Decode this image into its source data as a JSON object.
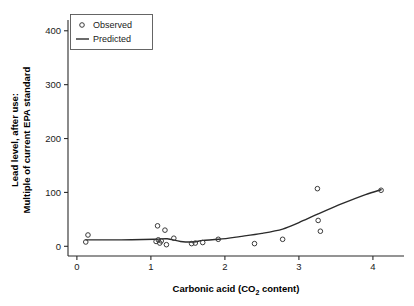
{
  "chart_data": {
    "type": "scatter",
    "title": "",
    "xlabel": "Carbonic acid (CO2 content)",
    "xlabel_main": "Carbonic acid (CO",
    "xlabel_sub": "2",
    "xlabel_tail": " content)",
    "ylabel_line1": "Lead level, after use:",
    "ylabel_line2": "Multiple of current EPA standard",
    "xlim": [
      -0.12,
      4.42
    ],
    "ylim": [
      -18,
      420
    ],
    "xticks": [
      0,
      1,
      2,
      3,
      4
    ],
    "xtick_labels": [
      "0",
      "1",
      "2",
      "3",
      "4"
    ],
    "yticks": [
      0,
      100,
      200,
      300,
      400
    ],
    "ytick_labels": [
      "0",
      "100",
      "200",
      "300",
      "400"
    ],
    "grid": false,
    "legend_position": "top-left",
    "legend": [
      {
        "label": "Observed",
        "marker": "circle"
      },
      {
        "label": "Predicted",
        "marker": "line"
      }
    ],
    "series": [
      {
        "name": "Observed",
        "type": "scatter",
        "marker": "open-circle",
        "color": "#3a3a3a",
        "points": [
          {
            "x": 0.12,
            "y": 8
          },
          {
            "x": 0.15,
            "y": 21
          },
          {
            "x": 1.07,
            "y": 9
          },
          {
            "x": 1.09,
            "y": 38
          },
          {
            "x": 1.1,
            "y": 12
          },
          {
            "x": 1.12,
            "y": 6
          },
          {
            "x": 1.14,
            "y": 10
          },
          {
            "x": 1.19,
            "y": 30
          },
          {
            "x": 1.21,
            "y": 3
          },
          {
            "x": 1.31,
            "y": 15
          },
          {
            "x": 1.55,
            "y": 5
          },
          {
            "x": 1.6,
            "y": 6
          },
          {
            "x": 1.7,
            "y": 7
          },
          {
            "x": 1.91,
            "y": 13
          },
          {
            "x": 2.4,
            "y": 5
          },
          {
            "x": 2.78,
            "y": 13
          },
          {
            "x": 3.25,
            "y": 107
          },
          {
            "x": 3.26,
            "y": 48
          },
          {
            "x": 3.29,
            "y": 28
          },
          {
            "x": 4.11,
            "y": 104
          }
        ]
      },
      {
        "name": "Predicted",
        "type": "line",
        "color": "#2b2b2b",
        "points": [
          {
            "x": 0.12,
            "y": 12
          },
          {
            "x": 0.6,
            "y": 12
          },
          {
            "x": 1.05,
            "y": 13
          },
          {
            "x": 1.22,
            "y": 14
          },
          {
            "x": 1.4,
            "y": 9
          },
          {
            "x": 1.58,
            "y": 8
          },
          {
            "x": 1.7,
            "y": 11
          },
          {
            "x": 1.92,
            "y": 13
          },
          {
            "x": 2.2,
            "y": 18
          },
          {
            "x": 2.5,
            "y": 24
          },
          {
            "x": 2.78,
            "y": 32
          },
          {
            "x": 3.0,
            "y": 44
          },
          {
            "x": 3.26,
            "y": 60
          },
          {
            "x": 3.6,
            "y": 80
          },
          {
            "x": 3.9,
            "y": 96
          },
          {
            "x": 4.11,
            "y": 105
          }
        ]
      }
    ]
  }
}
